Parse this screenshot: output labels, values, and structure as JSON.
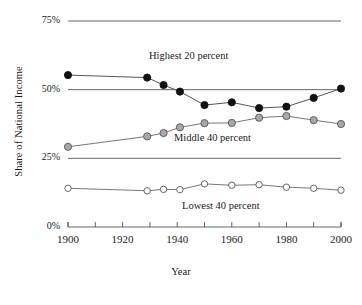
{
  "chart_data": {
    "type": "line",
    "title": "",
    "xlabel": "Year",
    "ylabel": "Share of National Income",
    "xlim": [
      1900,
      2000
    ],
    "ylim": [
      0,
      75
    ],
    "grid": true,
    "legend_position": "inline-annotations",
    "x_tick_labels": [
      "1900",
      "1920",
      "1940",
      "1960",
      "1980",
      "2000"
    ],
    "x_tick_values": [
      1900,
      1920,
      1940,
      1960,
      1980,
      2000
    ],
    "x_minor_ticks": [
      1910,
      1930,
      1950,
      1970,
      1990
    ],
    "y_tick_labels": [
      "0%",
      "25%",
      "50%",
      "75%"
    ],
    "y_tick_values": [
      0,
      25,
      50,
      75
    ],
    "gridlines": [
      25,
      50,
      75
    ],
    "series": [
      {
        "name": "Highest 20 percent",
        "marker": "filled-circle",
        "marker_color": "#111111",
        "line_color": "#555555",
        "x": [
          1900,
          1929,
          1935,
          1941,
          1950,
          1960,
          1970,
          1980,
          1990,
          2000
        ],
        "values": [
          55.3,
          54.4,
          51.7,
          49.3,
          44.4,
          45.4,
          43.3,
          43.8,
          47.0,
          50.4
        ]
      },
      {
        "name": "Middle 40 percent",
        "marker": "filled-circle",
        "marker_color": "#a8a8a8",
        "line_color": "#777777",
        "x": [
          1900,
          1929,
          1935,
          1941,
          1950,
          1960,
          1970,
          1980,
          1990,
          2000
        ],
        "values": [
          29.2,
          33.0,
          34.2,
          36.3,
          37.8,
          37.9,
          39.8,
          40.4,
          38.9,
          37.5
        ]
      },
      {
        "name": "Lowest 40 percent",
        "marker": "open-circle",
        "marker_color": "#ffffff",
        "line_color": "#777777",
        "x": [
          1900,
          1929,
          1935,
          1941,
          1950,
          1960,
          1970,
          1980,
          1990,
          2000
        ],
        "values": [
          14.1,
          13.2,
          13.7,
          13.6,
          15.7,
          15.2,
          15.4,
          14.5,
          14.1,
          13.4
        ]
      }
    ],
    "annotations": [
      {
        "text": "Highest 20 percent",
        "x_px": 149,
        "y_px": 50
      },
      {
        "text": "Middle 40 percent",
        "x_px": 174,
        "y_px": 132
      },
      {
        "text": "Lowest 40 percent",
        "x_px": 182,
        "y_px": 200
      }
    ]
  },
  "axes": {
    "y_title": "Share of National Income",
    "x_title": "Year"
  },
  "colors": {
    "highest": "#111111",
    "middle": "#a8a8a8",
    "lowest": "#ffffff",
    "line": "#666666",
    "grid": "#555555",
    "text": "#1a1a1a"
  }
}
